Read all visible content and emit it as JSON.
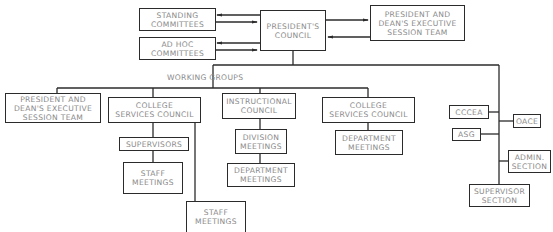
{
  "diagram": {
    "type": "org-chart",
    "line_color": "#2b2b2b",
    "text_color": "#8a8a8a",
    "nodes": {
      "standing_committees": {
        "line1": "STANDING",
        "line2": "COMMITTEES"
      },
      "ad_hoc_committees": {
        "line1": "AD  HOC",
        "line2": "COMMITTEES"
      },
      "presidents_council": {
        "line1": "PRESIDENT'S",
        "line2": "COUNCIL"
      },
      "pdest_top": {
        "line1": "PRESIDENT  AND",
        "line2": "DEAN'S  EXECUTIVE",
        "line3": "SESSION  TEAM"
      },
      "working_groups_label": "WORKING  GROUPS",
      "pdest_left": {
        "line1": "PRESIDENT  AND",
        "line2": "DEAN'S  EXECUTIVE",
        "line3": "SESSION  TEAM"
      },
      "college_services_council_1": {
        "line1": "COLLEGE",
        "line2": "SERVICES  COUNCIL"
      },
      "supervisors": {
        "line1": "SUPERVISORS"
      },
      "staff_meetings_1": {
        "line1": "STAFF",
        "line2": "MEETINGS"
      },
      "staff_meetings_2": {
        "line1": "STAFF",
        "line2": "MEETINGS"
      },
      "instructional_council": {
        "line1": "INSTRUCTIONAL",
        "line2": "COUNCIL"
      },
      "division_meetings": {
        "line1": "DIVISION",
        "line2": "MEETINGS"
      },
      "department_meetings_1": {
        "line1": "DEPARTMENT",
        "line2": "MEETINGS"
      },
      "college_services_council_2": {
        "line1": "COLLEGE",
        "line2": "SERVICES  COUNCIL"
      },
      "department_meetings_2": {
        "line1": "DEPARTMENT",
        "line2": "MEETINGS"
      },
      "cccea": {
        "line1": "CCCEA"
      },
      "oace": {
        "line1": "OACE"
      },
      "asg": {
        "line1": "ASG"
      },
      "admin_section": {
        "line1": "ADMIN.",
        "line2": "SECTION"
      },
      "supervisor_section": {
        "line1": "SUPERVISOR",
        "line2": "SECTION"
      }
    },
    "edges": [
      {
        "from": "presidents_council",
        "to": "standing_committees",
        "bidirectional": true
      },
      {
        "from": "presidents_council",
        "to": "ad_hoc_committees",
        "bidirectional": true
      },
      {
        "from": "presidents_council",
        "to": "pdest_top",
        "bidirectional": true
      },
      {
        "from": "presidents_council",
        "to": "working_groups_label"
      },
      {
        "from": "working_groups_label",
        "to": "pdest_left"
      },
      {
        "from": "working_groups_label",
        "to": "college_services_council_1"
      },
      {
        "from": "working_groups_label",
        "to": "instructional_council"
      },
      {
        "from": "working_groups_label",
        "to": "college_services_council_2"
      },
      {
        "from": "college_services_council_1",
        "to": "supervisors"
      },
      {
        "from": "supervisors",
        "to": "staff_meetings_1"
      },
      {
        "from": "college_services_council_1",
        "to": "staff_meetings_2"
      },
      {
        "from": "instructional_council",
        "to": "division_meetings"
      },
      {
        "from": "division_meetings",
        "to": "department_meetings_1"
      },
      {
        "from": "college_services_council_2",
        "to": "department_meetings_2"
      },
      {
        "from": "presidents_council",
        "to": "cccea"
      },
      {
        "from": "presidents_council",
        "to": "oace"
      },
      {
        "from": "presidents_council",
        "to": "asg"
      },
      {
        "from": "presidents_council",
        "to": "admin_section"
      },
      {
        "from": "presidents_council",
        "to": "supervisor_section"
      }
    ]
  }
}
